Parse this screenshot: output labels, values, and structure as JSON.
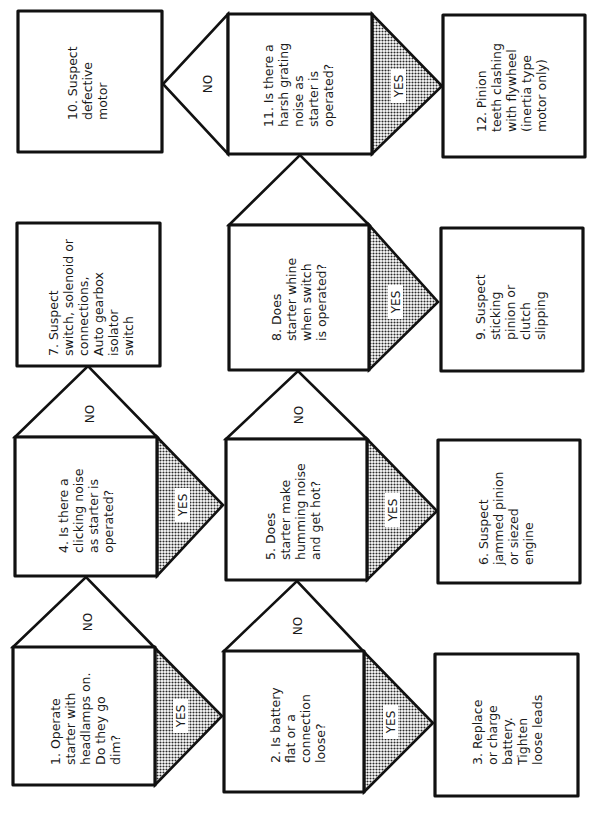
{
  "diagram": {
    "type": "troubleshooting-flowchart",
    "orientation": "rotated 90 degrees counter-clockwise",
    "colors": {
      "line": "#111111",
      "shading": "#8a8a8a",
      "background": "#ffffff"
    },
    "branch_labels": {
      "yes": "YES",
      "no": "NO"
    },
    "nodes": [
      {
        "id": 1,
        "kind": "question",
        "lines": [
          "1.  Operate",
          "starter with",
          "headlamps on.",
          "Do they go",
          "dim?"
        ]
      },
      {
        "id": 2,
        "kind": "question",
        "lines": [
          "2.  Is battery",
          "flat or a",
          "connection",
          "loose?"
        ]
      },
      {
        "id": 3,
        "kind": "action",
        "lines": [
          "3.  Replace",
          "or charge",
          "battery.",
          "Tighten",
          "loose leads"
        ]
      },
      {
        "id": 4,
        "kind": "question",
        "lines": [
          "4.  Is there a",
          "clicking noise",
          "as starter is",
          "operated?"
        ]
      },
      {
        "id": 5,
        "kind": "question",
        "lines": [
          "5.  Does",
          "starter make",
          "humming noise",
          "and get hot?"
        ]
      },
      {
        "id": 6,
        "kind": "action",
        "lines": [
          "6.  Suspect",
          "jammed pinion",
          "or siezed",
          "engine"
        ]
      },
      {
        "id": 7,
        "kind": "action",
        "lines": [
          "7.  Suspect",
          "switch, solenoid or",
          "connections,",
          "Auto gearbox",
          "isolator",
          "switch"
        ]
      },
      {
        "id": 8,
        "kind": "question",
        "lines": [
          "8.  Does",
          "starter whine",
          "when switch",
          "is operated?"
        ]
      },
      {
        "id": 9,
        "kind": "action",
        "lines": [
          "9.  Suspect",
          "sticking",
          "pinion or",
          "clutch",
          "slipping"
        ]
      },
      {
        "id": 10,
        "kind": "action",
        "lines": [
          "10.  Suspect",
          "defective",
          "motor"
        ]
      },
      {
        "id": 11,
        "kind": "question",
        "lines": [
          "11.  Is there a",
          "harsh grating",
          "noise as",
          "starter is",
          "operated?"
        ]
      },
      {
        "id": 12,
        "kind": "action",
        "lines": [
          "12.  Pinion",
          "teeth clashing",
          "with flywheel",
          "(inertia type",
          "motor only)"
        ]
      }
    ],
    "edges": [
      {
        "from": 1,
        "to": 4,
        "label": "NO"
      },
      {
        "from": 1,
        "to": 2,
        "label": "YES"
      },
      {
        "from": 2,
        "to": 5,
        "label": "NO"
      },
      {
        "from": 2,
        "to": 3,
        "label": "YES"
      },
      {
        "from": 4,
        "to": 7,
        "label": "NO"
      },
      {
        "from": 4,
        "to": 5,
        "label": "YES"
      },
      {
        "from": 5,
        "to": 8,
        "label": "NO"
      },
      {
        "from": 5,
        "to": 6,
        "label": "YES"
      },
      {
        "from": 8,
        "to": 11,
        "label": ""
      },
      {
        "from": 8,
        "to": 9,
        "label": "YES"
      },
      {
        "from": 11,
        "to": 10,
        "label": "NO"
      },
      {
        "from": 11,
        "to": 12,
        "label": "YES"
      }
    ]
  }
}
